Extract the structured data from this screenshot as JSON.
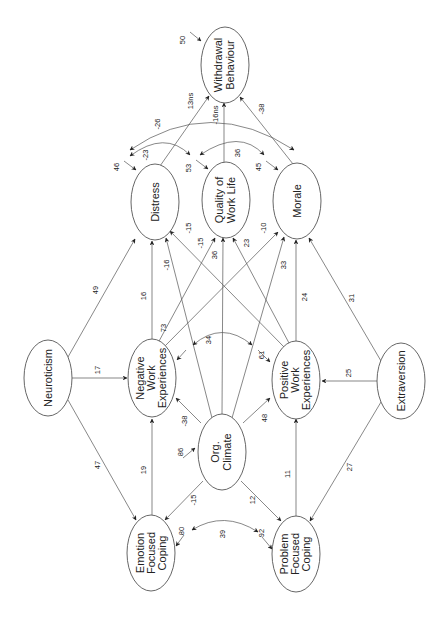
{
  "diagram": {
    "type": "structural-equation-path-diagram",
    "orientation": "rotated-90-ccw",
    "nodes": {
      "withdrawal": {
        "lines": [
          "Withdrawal",
          "Behaviour"
        ],
        "residual": "50"
      },
      "distress": {
        "lines": [
          "Distress"
        ],
        "residual": "46"
      },
      "qwl": {
        "lines": [
          "Quality of",
          "Work Life"
        ],
        "residual": "53"
      },
      "morale": {
        "lines": [
          "Morale"
        ],
        "residual": "45"
      },
      "neuroticism": {
        "lines": [
          "Neuroticism"
        ]
      },
      "negwork": {
        "lines": [
          "Negative",
          "Work",
          "Experiences"
        ],
        "residual": "73"
      },
      "orgclimate": {
        "lines": [
          "Org.",
          "Climate"
        ],
        "residual": "86"
      },
      "poswork": {
        "lines": [
          "Positive",
          "Work",
          "Experiences"
        ],
        "residual": "61"
      },
      "extraversion": {
        "lines": [
          "Extraversion"
        ]
      },
      "emotion": {
        "lines": [
          "Emotion",
          "Focused",
          "Coping"
        ],
        "residual": "80"
      },
      "problem": {
        "lines": [
          "Problem",
          "Focused",
          "Coping"
        ],
        "residual": "92"
      }
    },
    "paths": {
      "distress_withdrawal": "13ns",
      "qwl_withdrawal": "-16ns",
      "morale_withdrawal": "-38",
      "distress_morale_cov": "-26",
      "distress_qwl_cov": "-23",
      "qwl_morale_cov": "36",
      "neuro_distress": "49",
      "neuro_negwork": "17",
      "neuro_emotion": "47",
      "negwork_distress": "16",
      "negwork_qwl": "-15",
      "negwork_morale": "-10",
      "orgclimate_distress": "-16",
      "orgclimate_qwl": "36",
      "orgclimate_morale": "33",
      "poswork_distress": "-15",
      "poswork_qwl": "23",
      "poswork_morale": "24",
      "negwork_poswork_cov": "34",
      "orgclimate_negwork": "-38",
      "orgclimate_poswork": "48",
      "orgclimate_emotion": "-15",
      "orgclimate_problem": "12",
      "emotion_negwork": "19",
      "problem_poswork": "11",
      "extra_morale": "31",
      "extra_poswork": "25",
      "extra_problem": "27",
      "emotion_problem_cov": "39"
    }
  }
}
